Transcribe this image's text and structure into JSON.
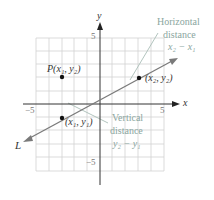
{
  "axes": {
    "x_label": "x",
    "y_label": "y",
    "tick_pos_x": "5",
    "tick_neg_x": "−5",
    "tick_pos_y": "5",
    "tick_neg_y": "−5",
    "range": [
      -5,
      5
    ]
  },
  "line": {
    "label": "L",
    "color": "#7a7a7a"
  },
  "points": {
    "p_corner": "P(x₁, y₂)",
    "p2": "(x₂, y₂)",
    "p1": "(x₁, y₁)"
  },
  "annotations": {
    "horizontal_line1": "Horizontal",
    "horizontal_line2": "distance",
    "horizontal_expr": "x₂ − x₁",
    "vertical_line1": "Vertical",
    "vertical_line2": "distance",
    "vertical_expr": "y₂ − y₁"
  },
  "colors": {
    "grid": "#cfcfcf",
    "axis": "#333333",
    "annotation": "#9cb3ad",
    "line": "#7a7a7a",
    "point": "#111111"
  }
}
